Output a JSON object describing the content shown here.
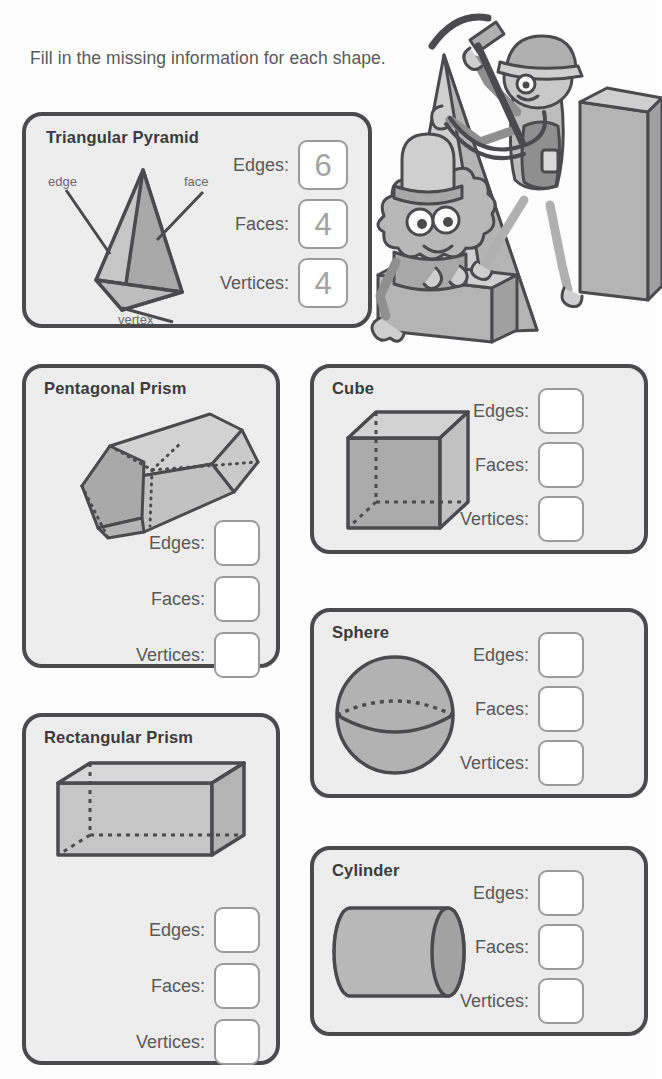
{
  "worksheet": {
    "instruction": "Fill in the missing information for each shape."
  },
  "labels": {
    "edges": "Edges:",
    "faces": "Faces:",
    "vertices": "Vertices:"
  },
  "annotations": {
    "edge": "edge",
    "face": "face",
    "vertex": "vertex"
  },
  "colors": {
    "card_fill": "#ededed",
    "card_border": "#4b4b4d",
    "box_fill": "#ffffff",
    "box_border": "#9a9a9c",
    "answer_text": "#a2a2a4",
    "title_text": "#3b3b3d",
    "label_text": "#58595b",
    "shape_light": "#d3d3d3",
    "shape_mid": "#b9b9b9",
    "shape_dark": "#a6a6a6",
    "shape_stroke": "#4b4b4d"
  },
  "cards": [
    {
      "id": "triangular-pyramid",
      "title": "Triangular Pyramid",
      "shape": "triangular-pyramid",
      "answers": {
        "edges": "6",
        "faces": "4",
        "vertices": "4"
      },
      "filled": true
    },
    {
      "id": "pentagonal-prism",
      "title": "Pentagonal Prism",
      "shape": "pentagonal-prism",
      "answers": {
        "edges": "",
        "faces": "",
        "vertices": ""
      },
      "filled": false
    },
    {
      "id": "cube",
      "title": "Cube",
      "shape": "cube",
      "answers": {
        "edges": "",
        "faces": "",
        "vertices": ""
      },
      "filled": false
    },
    {
      "id": "sphere",
      "title": "Sphere",
      "shape": "sphere",
      "answers": {
        "edges": "",
        "faces": "",
        "vertices": ""
      },
      "filled": false
    },
    {
      "id": "rectangular-prism",
      "title": "Rectangular Prism",
      "shape": "rectangular-prism",
      "answers": {
        "edges": "",
        "faces": "",
        "vertices": ""
      },
      "filled": false
    },
    {
      "id": "cylinder",
      "title": "Cylinder",
      "shape": "cylinder",
      "answers": {
        "edges": "",
        "faces": "",
        "vertices": ""
      },
      "filled": false
    }
  ],
  "illustration": {
    "name": "two-cartoon-characters-climbing-shapes",
    "description": "Cartoon character with hard hat and pickaxe climbing a pyramid beside a small furry character on a block"
  }
}
